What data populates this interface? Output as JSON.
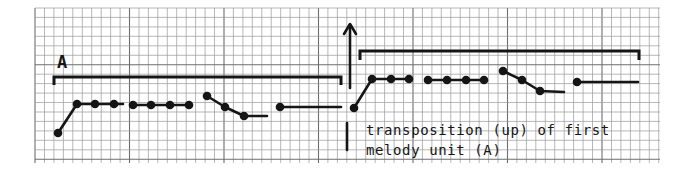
{
  "figure": {
    "kind": "hand-drawn melody contour on graph paper",
    "section_label": "A",
    "annotation_line1": "transposition (up) of first",
    "annotation_line2": "melody unit (A)",
    "ink_color": "#151515",
    "grid_color": "#9a9a9a",
    "grid_major_color": "#6e6e6e",
    "paper_color": "#ffffff"
  },
  "grid": {
    "x0": 35,
    "y0": 8,
    "x1": 660,
    "y1": 163,
    "step": 9.45,
    "major_every": 10
  },
  "unit_a": {
    "bracket": {
      "x1": 54,
      "x2": 341,
      "y": 77,
      "tick_down": 8
    },
    "segments": [
      {
        "points": [
          [
            58,
            133
          ],
          [
            77,
            104
          ],
          [
            95,
            104
          ],
          [
            114,
            104
          ]
        ],
        "tail": [
          123,
          104
        ]
      },
      {
        "points": [
          [
            133,
            105
          ],
          [
            151,
            105
          ],
          [
            170,
            105
          ],
          [
            189,
            105
          ]
        ]
      },
      {
        "points": [
          [
            207,
            96
          ],
          [
            225,
            107
          ],
          [
            244,
            116
          ]
        ],
        "tail": [
          267,
          116
        ]
      },
      {
        "points": [
          [
            280,
            107
          ]
        ],
        "tail": [
          341,
          107
        ]
      }
    ]
  },
  "unit_a_transposed": {
    "bracket": {
      "x1": 360,
      "x2": 639,
      "y": 51,
      "tick_down": 9
    },
    "segments": [
      {
        "points": [
          [
            354,
            108
          ],
          [
            372,
            79
          ],
          [
            391,
            79
          ],
          [
            409,
            79
          ]
        ]
      },
      {
        "points": [
          [
            428,
            80
          ],
          [
            447,
            80
          ],
          [
            466,
            80
          ],
          [
            484,
            80
          ]
        ]
      },
      {
        "points": [
          [
            503,
            71
          ],
          [
            522,
            80
          ],
          [
            540,
            91
          ]
        ],
        "tail": [
          564,
          92
        ]
      },
      {
        "points": [
          [
            577,
            82
          ]
        ],
        "tail": [
          638,
          82
        ]
      }
    ]
  },
  "arrow_up": {
    "x": 350,
    "y_top": 24,
    "y_bottom": 88
  },
  "marker_line": {
    "x": 347,
    "y_top": 123,
    "y_bottom": 150
  }
}
